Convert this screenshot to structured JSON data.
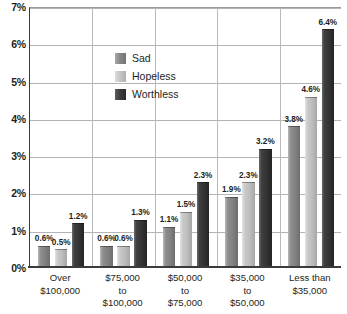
{
  "chart_data": {
    "type": "bar",
    "title": "",
    "subtitle": "",
    "xlabel": "",
    "ylabel": "",
    "ylim": [
      0,
      7
    ],
    "y_ticks": [
      "0%",
      "1%",
      "2%",
      "3%",
      "4%",
      "5%",
      "6%",
      "7%"
    ],
    "y_tick_values": [
      0,
      1,
      2,
      3,
      4,
      5,
      6,
      7
    ],
    "grid": true,
    "legend_position": "inside-upper-left",
    "categories": [
      [
        "Over",
        "$100,000"
      ],
      [
        "$75,000",
        "to",
        "$100,000"
      ],
      [
        "$50,000",
        "to",
        "$75,000"
      ],
      [
        "$35,000",
        "to",
        "$50,000"
      ],
      [
        "Less than",
        "$35,000"
      ]
    ],
    "category_labels": [
      "Over $100,000",
      "$75,000 to $100,000",
      "$50,000 to $75,000",
      "$35,000 to $50,000",
      "Less than $35,000"
    ],
    "series": [
      {
        "name": "Sad",
        "key": "sad",
        "color": "#858585",
        "values": [
          0.6,
          0.6,
          1.1,
          1.9,
          3.8
        ],
        "labels": [
          "0.6%",
          "0.6%",
          "1.1%",
          "1.9%",
          "3.8%"
        ]
      },
      {
        "name": "Hopeless",
        "key": "hopeless",
        "color": "#c4c4c4",
        "values": [
          0.5,
          0.6,
          1.5,
          2.3,
          4.6
        ],
        "labels": [
          "0.5%",
          "0.6%",
          "1.5%",
          "2.3%",
          "4.6%"
        ]
      },
      {
        "name": "Worthless",
        "key": "worthless",
        "color": "#333333",
        "values": [
          1.2,
          1.3,
          2.3,
          3.2,
          6.4
        ],
        "labels": [
          "1.2%",
          "1.3%",
          "2.3%",
          "3.2%",
          "6.4%"
        ]
      }
    ]
  },
  "legend": {
    "items": [
      {
        "label": "Sad",
        "key": "sad"
      },
      {
        "label": "Hopeless",
        "key": "hopeless"
      },
      {
        "label": "Worthless",
        "key": "worthless"
      }
    ]
  },
  "colors": {
    "axis": "#3b3b3b",
    "gridline": "#b4b4b4",
    "text": "#231f20",
    "background": "#ffffff",
    "series_sad": "#858585",
    "series_hopeless": "#c4c4c4",
    "series_worthless": "#333333"
  }
}
